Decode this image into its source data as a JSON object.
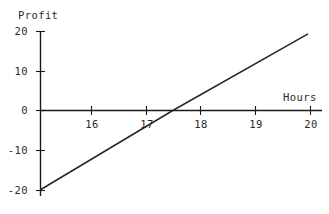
{
  "chart_data": {
    "type": "line",
    "title": "",
    "xlabel": "Hours",
    "ylabel": "Profit",
    "xlim": [
      15.07,
      20.2
    ],
    "ylim": [
      -20.5,
      20
    ],
    "grid": false,
    "legend": false,
    "xticks": [
      16,
      17,
      18,
      19,
      20
    ],
    "xtick_labels": [
      "16",
      "17",
      "18",
      "19",
      "20"
    ],
    "yticks": [
      20,
      10,
      0,
      -10,
      -20
    ],
    "ytick_labels": [
      "20",
      "10",
      "0",
      "-10",
      "-20"
    ],
    "series": [
      {
        "name": "Profit",
        "color": "#262626",
        "x": [
          15.07,
          17.48,
          19.95
        ],
        "values": [
          -20.0,
          0.0,
          19.4
        ]
      }
    ],
    "x_intercept": 17.48,
    "slope": 8.1
  },
  "axis_labels": {
    "y": "Profit",
    "x": "Hours"
  },
  "ticks": {
    "y": [
      {
        "label": "20"
      },
      {
        "label": "10"
      },
      {
        "label": "0"
      },
      {
        "label": "-10"
      },
      {
        "label": "-20"
      }
    ],
    "x": [
      {
        "label": "16"
      },
      {
        "label": "17"
      },
      {
        "label": "18"
      },
      {
        "label": "19"
      },
      {
        "label": "20"
      }
    ]
  },
  "colors": {
    "line": "#262626",
    "axis": "#1a1a1a",
    "text": "#2b2b2b",
    "background": "#ffffff"
  }
}
